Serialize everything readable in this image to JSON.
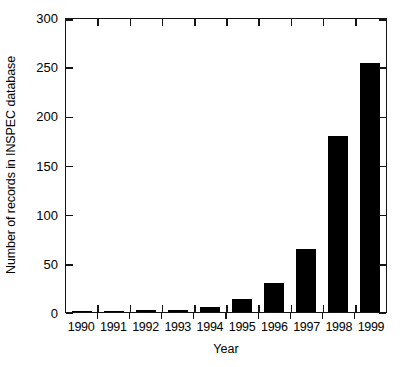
{
  "chart_data": {
    "type": "bar",
    "title": "",
    "xlabel": "Year",
    "ylabel": "Number of records in INSPEC database",
    "categories": [
      "1990",
      "1991",
      "1992",
      "1993",
      "1994",
      "1995",
      "1996",
      "1997",
      "1998",
      "1999"
    ],
    "values": [
      1,
      1,
      2,
      2,
      5,
      13,
      29,
      64,
      179,
      253
    ],
    "ylim": [
      0,
      300
    ],
    "yticks": [
      0,
      50,
      100,
      150,
      200,
      250,
      300
    ],
    "ytick_labels": [
      "0",
      "50",
      "100",
      "150",
      "200",
      "250",
      "300"
    ],
    "grid": false,
    "legend": null,
    "legend_position": "none",
    "bar_color": "#000000",
    "axis_color": "#141414",
    "background_color": "#ffffff",
    "series": [
      {
        "name": "Number of records in INSPEC database",
        "values": [
          1,
          1,
          2,
          2,
          5,
          13,
          29,
          64,
          179,
          253
        ]
      }
    ]
  }
}
